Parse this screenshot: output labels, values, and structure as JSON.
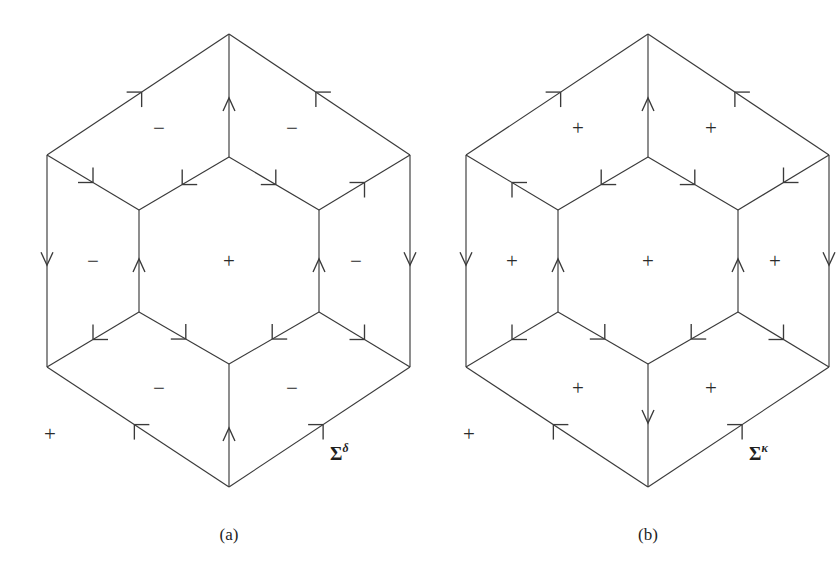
{
  "figure": {
    "width": 838,
    "height": 586,
    "background": "#ffffff",
    "line_color": "#3a3a3a"
  },
  "panels": [
    {
      "id": "a",
      "caption": "(a)",
      "caption_x": 229,
      "caption_y": 540,
      "label": {
        "base": "Σ",
        "superscript": "δ",
        "x": 330,
        "y": 460
      },
      "geometry": {
        "outer": [
          {
            "name": "top",
            "x": 229,
            "y": 34
          },
          {
            "name": "upper-right",
            "x": 410,
            "y": 155
          },
          {
            "name": "lower-right",
            "x": 410,
            "y": 367
          },
          {
            "name": "bottom",
            "x": 229,
            "y": 487
          },
          {
            "name": "lower-left",
            "x": 47,
            "y": 367
          },
          {
            "name": "upper-left",
            "x": 47,
            "y": 155
          }
        ],
        "inner": [
          {
            "name": "top",
            "x": 229,
            "y": 157
          },
          {
            "name": "upper-right",
            "x": 319,
            "y": 210
          },
          {
            "name": "lower-right",
            "x": 319,
            "y": 312
          },
          {
            "name": "bottom",
            "x": 229,
            "y": 364
          },
          {
            "name": "lower-left",
            "x": 139,
            "y": 312
          },
          {
            "name": "upper-left",
            "x": 139,
            "y": 210
          }
        ]
      },
      "edges": [
        {
          "name": "outer-top-left",
          "from": "outer.upper-left",
          "to": "outer.top",
          "arrow_at": 0.52,
          "direction": "forward",
          "head": "barb"
        },
        {
          "name": "outer-top-right",
          "from": "outer.upper-right",
          "to": "outer.top",
          "arrow_at": 0.52,
          "direction": "forward",
          "head": "barb"
        },
        {
          "name": "outer-left-vertical",
          "from": "outer.upper-left",
          "to": "outer.lower-left",
          "arrow_at": 0.52,
          "direction": "forward",
          "head": "vee"
        },
        {
          "name": "outer-right-vertical",
          "from": "outer.upper-right",
          "to": "outer.lower-right",
          "arrow_at": 0.52,
          "direction": "forward",
          "head": "vee"
        },
        {
          "name": "outer-bottom-left",
          "from": "outer.bottom",
          "to": "outer.lower-left",
          "arrow_at": 0.52,
          "direction": "forward",
          "head": "barb"
        },
        {
          "name": "outer-bottom-right",
          "from": "outer.bottom",
          "to": "outer.lower-right",
          "arrow_at": 0.52,
          "direction": "forward",
          "head": "barb"
        },
        {
          "name": "inner-top-left",
          "from": "inner.top",
          "to": "inner.upper-left",
          "arrow_at": 0.52,
          "direction": "forward",
          "head": "barb"
        },
        {
          "name": "inner-top-right",
          "from": "inner.top",
          "to": "inner.upper-right",
          "arrow_at": 0.52,
          "direction": "forward",
          "head": "barb"
        },
        {
          "name": "inner-left-vertical",
          "from": "inner.lower-left",
          "to": "inner.upper-left",
          "arrow_at": 0.52,
          "direction": "forward",
          "head": "vee"
        },
        {
          "name": "inner-right-vertical",
          "from": "inner.lower-right",
          "to": "inner.upper-right",
          "arrow_at": 0.52,
          "direction": "forward",
          "head": "vee"
        },
        {
          "name": "inner-bottom-left",
          "from": "inner.lower-left",
          "to": "inner.bottom",
          "arrow_at": 0.52,
          "direction": "forward",
          "head": "barb"
        },
        {
          "name": "inner-bottom-right",
          "from": "inner.lower-right",
          "to": "inner.bottom",
          "arrow_at": 0.52,
          "direction": "forward",
          "head": "barb"
        },
        {
          "name": "spoke-top",
          "from": "inner.top",
          "to": "outer.top",
          "arrow_at": 0.48,
          "direction": "forward",
          "head": "vee"
        },
        {
          "name": "spoke-upper-right",
          "from": "inner.upper-right",
          "to": "outer.upper-right",
          "arrow_at": 0.5,
          "direction": "forward",
          "head": "barb"
        },
        {
          "name": "spoke-lower-right",
          "from": "inner.lower-right",
          "to": "outer.lower-right",
          "arrow_at": 0.5,
          "direction": "forward",
          "head": "barb"
        },
        {
          "name": "spoke-bottom",
          "from": "inner.bottom",
          "to": "outer.bottom",
          "arrow_at": 0.48,
          "direction": "backward",
          "head": "vee"
        },
        {
          "name": "spoke-lower-left",
          "from": "inner.lower-left",
          "to": "outer.lower-left",
          "arrow_at": 0.5,
          "direction": "forward",
          "head": "barb"
        },
        {
          "name": "spoke-upper-left",
          "from": "inner.upper-left",
          "to": "outer.upper-left",
          "arrow_at": 0.5,
          "direction": "backward",
          "head": "barb"
        }
      ],
      "signs": [
        {
          "name": "face-upper-left",
          "text": "−",
          "x": 159,
          "y": 128
        },
        {
          "name": "face-upper-right",
          "text": "−",
          "x": 292,
          "y": 128
        },
        {
          "name": "face-left",
          "text": "−",
          "x": 93,
          "y": 261
        },
        {
          "name": "face-center",
          "text": "+",
          "x": 229,
          "y": 261
        },
        {
          "name": "face-right",
          "text": "−",
          "x": 356,
          "y": 261
        },
        {
          "name": "face-lower-left",
          "text": "−",
          "x": 159,
          "y": 388
        },
        {
          "name": "face-lower-right",
          "text": "−",
          "x": 292,
          "y": 388
        },
        {
          "name": "face-outer",
          "text": "+",
          "x": 50,
          "y": 434
        }
      ]
    },
    {
      "id": "b",
      "caption": "(b)",
      "caption_x": 229,
      "caption_y": 540,
      "label": {
        "base": "Σ",
        "superscript": "κ",
        "x": 330,
        "y": 460
      },
      "geometry": {
        "outer": [
          {
            "name": "top",
            "x": 229,
            "y": 34
          },
          {
            "name": "upper-right",
            "x": 410,
            "y": 155
          },
          {
            "name": "lower-right",
            "x": 410,
            "y": 367
          },
          {
            "name": "bottom",
            "x": 229,
            "y": 487
          },
          {
            "name": "lower-left",
            "x": 47,
            "y": 367
          },
          {
            "name": "upper-left",
            "x": 47,
            "y": 155
          }
        ],
        "inner": [
          {
            "name": "top",
            "x": 229,
            "y": 157
          },
          {
            "name": "upper-right",
            "x": 319,
            "y": 210
          },
          {
            "name": "lower-right",
            "x": 319,
            "y": 312
          },
          {
            "name": "bottom",
            "x": 229,
            "y": 364
          },
          {
            "name": "lower-left",
            "x": 139,
            "y": 312
          },
          {
            "name": "upper-left",
            "x": 139,
            "y": 210
          }
        ]
      },
      "edges": [
        {
          "name": "outer-top-left",
          "from": "outer.upper-left",
          "to": "outer.top",
          "arrow_at": 0.52,
          "direction": "forward",
          "head": "barb"
        },
        {
          "name": "outer-top-right",
          "from": "outer.upper-right",
          "to": "outer.top",
          "arrow_at": 0.52,
          "direction": "forward",
          "head": "barb"
        },
        {
          "name": "outer-left-vertical",
          "from": "outer.upper-left",
          "to": "outer.lower-left",
          "arrow_at": 0.52,
          "direction": "forward",
          "head": "vee"
        },
        {
          "name": "outer-right-vertical",
          "from": "outer.upper-right",
          "to": "outer.lower-right",
          "arrow_at": 0.52,
          "direction": "forward",
          "head": "vee"
        },
        {
          "name": "outer-bottom-left",
          "from": "outer.bottom",
          "to": "outer.lower-left",
          "arrow_at": 0.52,
          "direction": "forward",
          "head": "barb"
        },
        {
          "name": "outer-bottom-right",
          "from": "outer.bottom",
          "to": "outer.lower-right",
          "arrow_at": 0.52,
          "direction": "forward",
          "head": "barb"
        },
        {
          "name": "inner-top-left",
          "from": "inner.top",
          "to": "inner.upper-left",
          "arrow_at": 0.52,
          "direction": "forward",
          "head": "barb"
        },
        {
          "name": "inner-top-right",
          "from": "inner.top",
          "to": "inner.upper-right",
          "arrow_at": 0.52,
          "direction": "forward",
          "head": "barb"
        },
        {
          "name": "inner-left-vertical",
          "from": "inner.lower-left",
          "to": "inner.upper-left",
          "arrow_at": 0.52,
          "direction": "forward",
          "head": "vee"
        },
        {
          "name": "inner-right-vertical",
          "from": "inner.lower-right",
          "to": "inner.upper-right",
          "arrow_at": 0.52,
          "direction": "forward",
          "head": "vee"
        },
        {
          "name": "inner-bottom-left",
          "from": "inner.lower-left",
          "to": "inner.bottom",
          "arrow_at": 0.52,
          "direction": "forward",
          "head": "barb"
        },
        {
          "name": "inner-bottom-right",
          "from": "inner.lower-right",
          "to": "inner.bottom",
          "arrow_at": 0.52,
          "direction": "forward",
          "head": "barb"
        },
        {
          "name": "spoke-top",
          "from": "inner.top",
          "to": "outer.top",
          "arrow_at": 0.48,
          "direction": "forward",
          "head": "vee"
        },
        {
          "name": "spoke-upper-right",
          "from": "inner.upper-right",
          "to": "outer.upper-right",
          "arrow_at": 0.5,
          "direction": "backward",
          "head": "barb"
        },
        {
          "name": "spoke-lower-right",
          "from": "inner.lower-right",
          "to": "outer.lower-right",
          "arrow_at": 0.5,
          "direction": "forward",
          "head": "barb"
        },
        {
          "name": "spoke-bottom",
          "from": "inner.bottom",
          "to": "outer.bottom",
          "arrow_at": 0.48,
          "direction": "forward",
          "head": "vee"
        },
        {
          "name": "spoke-lower-left",
          "from": "inner.lower-left",
          "to": "outer.lower-left",
          "arrow_at": 0.5,
          "direction": "forward",
          "head": "barb"
        },
        {
          "name": "spoke-upper-left",
          "from": "inner.upper-left",
          "to": "outer.upper-left",
          "arrow_at": 0.5,
          "direction": "forward",
          "head": "barb"
        }
      ],
      "signs": [
        {
          "name": "face-upper-left",
          "text": "+",
          "x": 159,
          "y": 128
        },
        {
          "name": "face-upper-right",
          "text": "+",
          "x": 292,
          "y": 128
        },
        {
          "name": "face-left",
          "text": "+",
          "x": 93,
          "y": 261
        },
        {
          "name": "face-center",
          "text": "+",
          "x": 229,
          "y": 261
        },
        {
          "name": "face-right",
          "text": "+",
          "x": 356,
          "y": 261
        },
        {
          "name": "face-lower-left",
          "text": "+",
          "x": 159,
          "y": 388
        },
        {
          "name": "face-lower-right",
          "text": "+",
          "x": 292,
          "y": 388
        },
        {
          "name": "face-outer",
          "text": "+",
          "x": 50,
          "y": 434
        }
      ]
    }
  ]
}
